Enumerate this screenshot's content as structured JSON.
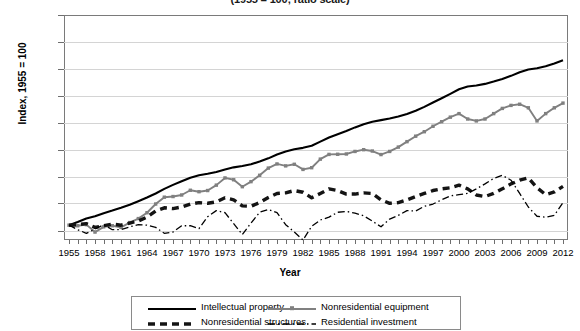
{
  "chart_data": {
    "type": "line",
    "title": "(1955 = 100; ratio scale)",
    "xlabel": "Year",
    "ylabel": "Index, 1955 = 100",
    "yscale": "log",
    "ylim": [
      76,
      4910
    ],
    "ytick_labels": [
      "4910",
      "2980",
      "1810",
      "1100",
      "665",
      "405",
      "245",
      "150",
      "90"
    ],
    "ytick_values": [
      4910,
      2980,
      1810,
      1100,
      665,
      405,
      245,
      150,
      90
    ],
    "grid": true,
    "legend_position": "bottom",
    "x": [
      1955,
      1956,
      1957,
      1958,
      1959,
      1960,
      1961,
      1962,
      1963,
      1964,
      1965,
      1966,
      1967,
      1968,
      1969,
      1970,
      1971,
      1972,
      1973,
      1974,
      1975,
      1976,
      1977,
      1978,
      1979,
      1980,
      1981,
      1982,
      1983,
      1984,
      1985,
      1986,
      1987,
      1988,
      1989,
      1990,
      1991,
      1992,
      1993,
      1994,
      1995,
      1996,
      1997,
      1998,
      1999,
      2000,
      2001,
      2002,
      2003,
      2004,
      2005,
      2006,
      2007,
      2008,
      2009,
      2010,
      2011,
      2012
    ],
    "xtick_labels": [
      "1955",
      "1958",
      "1961",
      "1964",
      "1967",
      "1970",
      "1973",
      "1976",
      "1979",
      "1982",
      "1985",
      "1988",
      "1991",
      "1994",
      "1997",
      "2000",
      "2003",
      "2006",
      "2009",
      "2012"
    ],
    "series": [
      {
        "name": "Intellectual property",
        "style": "solid-black",
        "color": "#000000",
        "values": [
          100,
          106,
          113,
          118,
          125,
          131,
          138,
          146,
          156,
          167,
          180,
          196,
          211,
          226,
          241,
          252,
          259,
          268,
          281,
          292,
          299,
          309,
          325,
          345,
          370,
          391,
          408,
          419,
          436,
          470,
          508,
          540,
          573,
          612,
          650,
          680,
          700,
          722,
          748,
          785,
          833,
          895,
          970,
          1050,
          1140,
          1240,
          1305,
          1330,
          1370,
          1430,
          1500,
          1590,
          1700,
          1790,
          1830,
          1900,
          2000,
          2120
        ],
        "endpoints": {
          "1955": 100,
          "1980": 391,
          "2000": 1240,
          "2012": 2120
        }
      },
      {
        "name": "Nonresidential equipment",
        "style": "solid-gray-marker",
        "color": "#808080",
        "values": [
          100,
          99,
          101,
          88,
          97,
          99,
          96,
          105,
          113,
          126,
          148,
          168,
          170,
          175,
          191,
          186,
          190,
          210,
          240,
          232,
          204,
          224,
          252,
          288,
          311,
          300,
          309,
          281,
          290,
          340,
          371,
          372,
          374,
          392,
          405,
          395,
          370,
          392,
          425,
          470,
          520,
          565,
          625,
          680,
          740,
          790,
          715,
          690,
          715,
          790,
          870,
          920,
          940,
          880,
          690,
          790,
          880,
          960
        ],
        "endpoints": {
          "1955": 100,
          "1982": 281,
          "2000": 790,
          "2009": 690,
          "2012": 960
        }
      },
      {
        "name": "Nonresidential structures",
        "style": "dashed-thick-black",
        "color": "#000000",
        "values": [
          100,
          101,
          103,
          96,
          99,
          102,
          100,
          104,
          108,
          116,
          130,
          138,
          136,
          140,
          148,
          152,
          150,
          154,
          166,
          160,
          143,
          142,
          152,
          167,
          180,
          182,
          190,
          184,
          166,
          180,
          196,
          190,
          178,
          178,
          182,
          180,
          160,
          150,
          152,
          160,
          170,
          180,
          190,
          196,
          200,
          210,
          196,
          175,
          170,
          180,
          196,
          215,
          230,
          240,
          200,
          176,
          185,
          205
        ],
        "endpoints": {
          "1955": 100,
          "1970": 152,
          "2006": 215,
          "2008": 240,
          "2012": 205
        }
      },
      {
        "name": "Residential investment",
        "style": "dash-dot-black",
        "color": "#000000",
        "values": [
          100,
          92,
          86,
          93,
          101,
          92,
          92,
          97,
          101,
          100,
          96,
          86,
          88,
          99,
          99,
          94,
          117,
          131,
          126,
          103,
          84,
          104,
          127,
          134,
          126,
          101,
          88,
          76,
          98,
          110,
          116,
          127,
          129,
          125,
          119,
          108,
          97,
          112,
          120,
          131,
          130,
          142,
          148,
          160,
          172,
          176,
          180,
          196,
          215,
          238,
          252,
          230,
          180,
          140,
          118,
          116,
          120,
          152
        ],
        "endpoints": {
          "1955": 100,
          "1982": 76,
          "2005": 252,
          "2009": 118,
          "2012": 152
        }
      }
    ]
  },
  "legend": {
    "items": [
      {
        "label": "Intellectual property",
        "key": "solid-black"
      },
      {
        "label": "Nonresidential equipment",
        "key": "solid-gray-marker"
      },
      {
        "label": "Nonresidential structures",
        "key": "dashed-thick-black"
      },
      {
        "label": "Residential investment",
        "key": "dash-dot-black"
      }
    ]
  }
}
